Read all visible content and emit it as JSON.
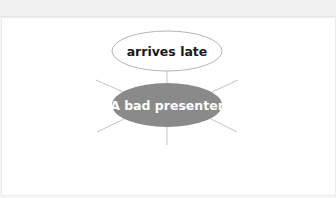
{
  "diagram": {
    "type": "mind-map",
    "center_node": {
      "label": "A bad presenter",
      "fill": "#8a8a8a",
      "text_color": "#ffffff"
    },
    "branch_nodes": [
      {
        "label": "arrives late",
        "fill": "#ffffff",
        "stroke": "#b5b5b5",
        "text_color": "#1a1a1a"
      }
    ],
    "empty_branches": [
      "upper-left",
      "upper-right",
      "lower-left",
      "lower-right",
      "bottom"
    ],
    "connector_color": "#c4c4c4"
  }
}
